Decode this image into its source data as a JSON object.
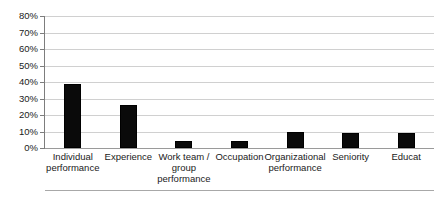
{
  "chart_data": {
    "type": "bar",
    "title": "",
    "subtitle": "",
    "xlabel": "",
    "ylabel": "",
    "ylim": [
      0,
      80
    ],
    "y_tick_step": 10,
    "grid": true,
    "legend": false,
    "value_unit": "%",
    "axis_tick_labels": [
      "0%",
      "10%",
      "20%",
      "30%",
      "40%",
      "50%",
      "60%",
      "70%",
      "80%"
    ],
    "axis_tick_values": [
      0,
      10,
      20,
      30,
      40,
      50,
      60,
      70,
      80
    ],
    "categories": [
      "Individual performance",
      "Experience",
      "Work team / group performance",
      "Occupation",
      "Organizational performance",
      "Seniority",
      "Educat"
    ],
    "category_label_lines": [
      [
        "Individual",
        "performance"
      ],
      [
        "Experience"
      ],
      [
        "Work team /",
        "group",
        "performance"
      ],
      [
        "Occupation"
      ],
      [
        "Organizational",
        "performance"
      ],
      [
        "Seniority"
      ],
      [
        "Educat"
      ]
    ],
    "values": [
      39,
      26,
      4.5,
      4,
      10,
      9,
      9
    ],
    "bar_color": "#0a0a0a",
    "gridline_color": "#d0d0d0",
    "axis_color": "#7d7d7d",
    "background_color": "#ffffff"
  }
}
